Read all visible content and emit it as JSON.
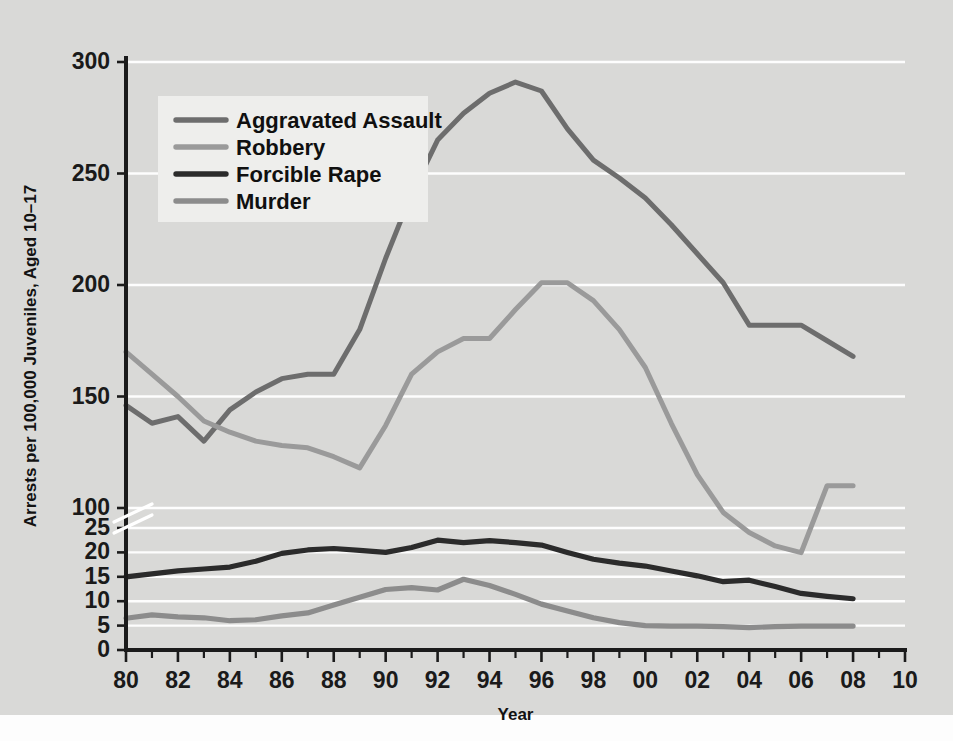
{
  "chart_data": {
    "type": "line",
    "title": "",
    "xlabel": "Year",
    "ylabel": "Arrests per 100,000 Juveniles, Aged 10–17",
    "x": [
      1980,
      1981,
      1982,
      1983,
      1984,
      1985,
      1986,
      1987,
      1988,
      1989,
      1990,
      1991,
      1992,
      1993,
      1994,
      1995,
      1996,
      1997,
      1998,
      1999,
      2000,
      2001,
      2002,
      2003,
      2004,
      2005,
      2006,
      2007,
      2008
    ],
    "xtick_labels": [
      "80",
      "",
      "82",
      "",
      "84",
      "",
      "86",
      "",
      "88",
      "",
      "90",
      "",
      "92",
      "",
      "94",
      "",
      "96",
      "",
      "98",
      "",
      "00",
      "",
      "02",
      "",
      "04",
      "",
      "06",
      "",
      "08"
    ],
    "xtick_labels_shown": [
      "80",
      "82",
      "84",
      "86",
      "88",
      "90",
      "92",
      "94",
      "96",
      "98",
      "00",
      "02",
      "04",
      "06",
      "08",
      "10"
    ],
    "xlim": [
      1980,
      2010
    ],
    "grid": true,
    "legend_position": "upper-left-inside",
    "axis_break": true,
    "upper_axis": {
      "ticks": [
        100,
        150,
        200,
        250,
        300
      ],
      "tick_labels": [
        "100",
        "150",
        "200",
        "250",
        "300"
      ],
      "range": [
        100,
        300
      ]
    },
    "lower_axis": {
      "ticks": [
        0,
        5,
        10,
        15,
        20,
        25
      ],
      "tick_labels": [
        "0",
        "5",
        "10",
        "15",
        "20",
        "25"
      ],
      "range": [
        0,
        25
      ]
    },
    "series": [
      {
        "name": "Aggravated Assault",
        "color": "#6d6d6d",
        "panel": "upper",
        "values": [
          146,
          138,
          141,
          130,
          144,
          152,
          158,
          160,
          160,
          180,
          212,
          241,
          265,
          277,
          286,
          291,
          287,
          270,
          256,
          248,
          239,
          227,
          214,
          201,
          182,
          182,
          182,
          175,
          168
        ]
      },
      {
        "name": "Robbery",
        "color": "#9a9a9a",
        "panel": "upper",
        "values": [
          170,
          160,
          150,
          139,
          134,
          130,
          128,
          127,
          123,
          118,
          137,
          160,
          170,
          176,
          176,
          189,
          201,
          201,
          193,
          180,
          163,
          138,
          115,
          98,
          89,
          83,
          80,
          110,
          110
        ]
      },
      {
        "name": "Forcible Rape",
        "color": "#2b2b2b",
        "panel": "lower",
        "values": [
          15.0,
          15.6,
          16.2,
          16.6,
          17.0,
          18.2,
          19.8,
          20.5,
          20.8,
          20.4,
          20.0,
          21.0,
          22.5,
          22.0,
          22.4,
          22.0,
          21.5,
          20.0,
          18.6,
          17.8,
          17.2,
          16.2,
          15.2,
          14.0,
          14.3,
          13.0,
          11.6,
          11.0,
          10.5
        ]
      },
      {
        "name": "Murder",
        "color": "#8c8c8c",
        "panel": "lower",
        "values": [
          6.5,
          7.2,
          6.8,
          6.6,
          6.0,
          6.2,
          7.0,
          7.6,
          9.2,
          10.8,
          12.4,
          12.8,
          12.3,
          14.5,
          13.2,
          11.4,
          9.4,
          8.0,
          6.6,
          5.6,
          5.0,
          4.9,
          4.9,
          4.8,
          4.6,
          4.8,
          4.9,
          4.9,
          4.9
        ]
      }
    ]
  },
  "legend": {
    "entries": [
      {
        "label": "Aggravated Assault"
      },
      {
        "label": "Robbery"
      },
      {
        "label": "Forcible Rape"
      },
      {
        "label": "Murder"
      }
    ]
  },
  "colors": {
    "background": "#d9d9d7",
    "gridline": "#fdfdfd",
    "axis": "#1b1b1b",
    "text": "#121212",
    "legend_background": "#eeeeec"
  }
}
